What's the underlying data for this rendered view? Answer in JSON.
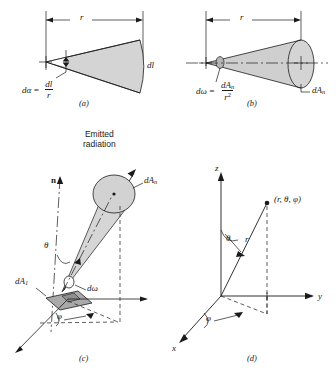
{
  "figure": {
    "type": "technical-diagram",
    "panels": [
      {
        "id": "a",
        "caption": "(a)",
        "labels": {
          "radius": "r",
          "arc": "dl",
          "formula_lhs": "dα",
          "formula_eq": "=",
          "formula_num": "dl",
          "formula_den": "r"
        }
      },
      {
        "id": "b",
        "caption": "(b)",
        "labels": {
          "radius": "r",
          "area": "dA",
          "area_sub": "n",
          "formula_lhs": "dω",
          "formula_eq": "=",
          "formula_num": "dA",
          "formula_num_sub": "n",
          "formula_den": "r",
          "formula_den_sup": "2"
        }
      },
      {
        "id": "c",
        "caption": "(c)",
        "labels": {
          "emitted_radiation": "Emitted\nradiation",
          "normal": "n",
          "theta": "θ",
          "phi": "φ",
          "solid_angle": "dω",
          "area_n": "dA",
          "area_n_sub": "n",
          "area_1": "dA",
          "area_1_sub": "1"
        }
      },
      {
        "id": "d",
        "caption": "(d)",
        "labels": {
          "axis_z": "z",
          "axis_y": "y",
          "axis_x": "x",
          "radius": "r",
          "theta": "θ",
          "phi": "φ",
          "point": "(r, θ, φ)"
        }
      }
    ]
  },
  "colors": {
    "line": "#1a1a1a",
    "fill_light": "#d9d9d9",
    "fill_mid": "#c8c8c8",
    "fill_dark": "#a8a8a8",
    "background": "#ffffff"
  }
}
